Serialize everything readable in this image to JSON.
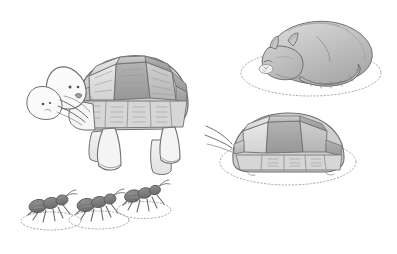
{
  "scene": {
    "title": "Pencil sketch of a tortoise, a sleeping cat, a hiding tortoise and three ants",
    "medium": "graphite pencil drawing",
    "background_color": "#ffffff",
    "canvas": {
      "width": 397,
      "height": 254
    },
    "line_color": "#6f6f70",
    "shade_light": "#dcdcdc",
    "shade_mid": "#bdbdbd",
    "shade_dark": "#9a9a9a",
    "guide_color": "#a9a9aa"
  },
  "subjects": [
    {
      "id": "walking-tortoise",
      "label": "Large walking tortoise",
      "position": "left-center",
      "notes": "Domed segmented shell, four stumpy legs, two overlapping head outlines suggesting motion, open mouth, whisker-like stroke lines"
    },
    {
      "id": "sleeping-cat",
      "label": "Curled sleeping cat",
      "position": "top-right",
      "notes": "Tabby cat curled nose-to-tail, striped tail wrapped around body, resting on a dotted oval mat"
    },
    {
      "id": "hiding-tortoise",
      "label": "Tortoise withdrawn into its shell",
      "position": "middle-right",
      "notes": "Head and limbs tucked in, small stroke lines at the front, resting on a dotted oval mat"
    },
    {
      "id": "ant-left",
      "label": "Ant facing right",
      "position": "bottom-left",
      "notes": "Three body segments, six legs, two antennae, standing on a dotted oval"
    },
    {
      "id": "ant-middle",
      "label": "Ant facing right",
      "position": "bottom-center-left",
      "notes": "Three body segments, six legs, two antennae, standing on a dotted oval"
    },
    {
      "id": "ant-right",
      "label": "Ant facing right, raised",
      "position": "bottom-center",
      "notes": "Three body segments, six legs, two antennae, standing on a dotted oval"
    }
  ],
  "guides": [
    {
      "id": "cat-mat",
      "shape": "dotted ellipse",
      "under": "sleeping-cat"
    },
    {
      "id": "hiding-tortoise-mat",
      "shape": "dotted ellipse",
      "under": "hiding-tortoise"
    },
    {
      "id": "ant-left-mat",
      "shape": "dotted ellipse",
      "under": "ant-left"
    },
    {
      "id": "ant-middle-mat",
      "shape": "dotted ellipse",
      "under": "ant-middle"
    },
    {
      "id": "ant-right-mat",
      "shape": "dotted ellipse",
      "under": "ant-right"
    }
  ]
}
